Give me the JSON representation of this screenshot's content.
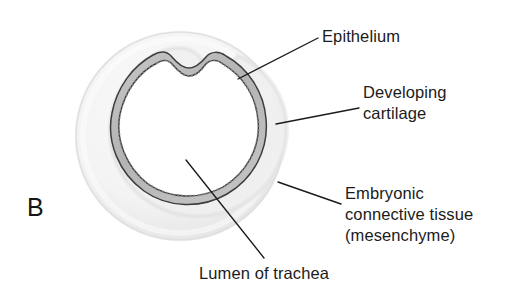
{
  "figure": {
    "panel_letter": "B",
    "background_color": "#ffffff",
    "ink_color": "#1b1b1b"
  },
  "structures": {
    "epithelium": {
      "name": "epithelium-band",
      "fill_color": "#b9b9b9",
      "outline_color": "#3a3a3a"
    },
    "developing_cartilage": {
      "name": "developing-cartilage-ring",
      "fill_color": "#ededed",
      "outline_color": "#cfcfcf"
    },
    "mesenchyme": {
      "name": "embryonic-connective-tissue-ring",
      "fill_color": "#f4f4f4",
      "outline_color": "#e2e2e2"
    },
    "lumen": {
      "name": "tracheal-lumen",
      "fill_color": "#ffffff"
    }
  },
  "labels": {
    "epithelium": "Epithelium",
    "cartilage_line1": "Developing",
    "cartilage_line2": "cartilage",
    "mesenchyme_line1": "Embryonic",
    "mesenchyme_line2": "connective tissue",
    "mesenchyme_line3": "(mesenchyme)",
    "lumen": "Lumen of trachea"
  },
  "leader_lines": [
    {
      "name": "leader-epithelium",
      "from": [
        238,
        79
      ],
      "to": [
        318,
        38
      ]
    },
    {
      "name": "leader-cartilage",
      "from": [
        276,
        124
      ],
      "to": [
        359,
        108
      ]
    },
    {
      "name": "leader-mesenchyme",
      "from": [
        278,
        182
      ],
      "to": [
        341,
        204
      ]
    },
    {
      "name": "leader-lumen",
      "from": [
        186,
        160
      ],
      "to": [
        264,
        258
      ]
    }
  ]
}
